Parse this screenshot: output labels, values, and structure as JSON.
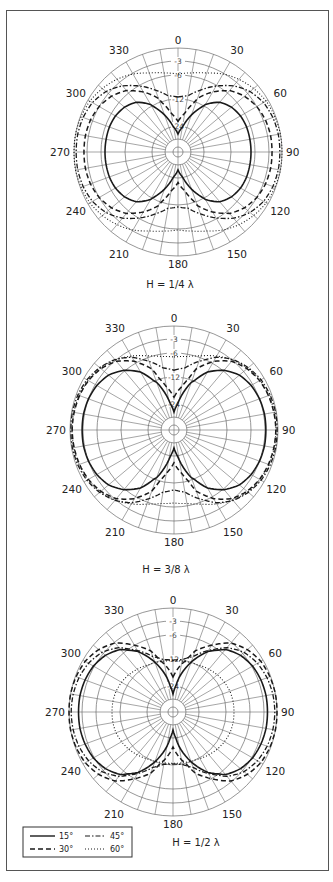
{
  "chart_data": [
    {
      "type": "polar",
      "caption": "H = 1/4 λ",
      "center": [
        178,
        152
      ],
      "angle_labels": [
        "0",
        "30",
        "60",
        "90",
        "120",
        "150",
        "180",
        "210",
        "240",
        "270",
        "300",
        "330"
      ],
      "ring_labels": [
        "-3",
        "-6",
        "-12",
        "-24"
      ],
      "rings_db": [
        0,
        -3,
        -6,
        -12,
        -24
      ],
      "angle_step_deg": 10,
      "series_angles_deg": [
        0,
        10,
        20,
        30,
        40,
        50,
        60,
        70,
        80,
        90
      ],
      "series": [
        {
          "name": "15°",
          "style": "solid",
          "db": [
            -30,
            -24.5,
            -18,
            -11.5,
            -9,
            -7.8,
            -7.2,
            -7,
            -7,
            -7
          ]
        },
        {
          "name": "30°",
          "style": "dashed",
          "db": [
            -22,
            -18,
            -11,
            -7.9,
            -5.3,
            -3.9,
            -3,
            -2.5,
            -2.3,
            -2.3
          ]
        },
        {
          "name": "45°",
          "style": "dashdot",
          "db": [
            -11.5,
            -11,
            -8.8,
            -6.2,
            -4,
            -2.3,
            -1.2,
            -0.7,
            -0.5,
            -0.5
          ]
        },
        {
          "name": "60°",
          "style": "dotted",
          "db": [
            -5.8,
            -5.3,
            -4.5,
            -3.2,
            -2.1,
            -1.2,
            -0.5,
            -0.2,
            0,
            0
          ]
        }
      ]
    },
    {
      "type": "polar",
      "caption": "H = 3/8 λ",
      "center": [
        174,
        430
      ],
      "angle_labels": [
        "0",
        "30",
        "60",
        "90",
        "120",
        "150",
        "180",
        "210",
        "240",
        "270",
        "300",
        "330"
      ],
      "ring_labels": [
        "-3",
        "-6",
        "-12",
        "-24"
      ],
      "rings_db": [
        0,
        -3,
        -6,
        -12,
        -24
      ],
      "angle_step_deg": 10,
      "series_angles_deg": [
        0,
        10,
        20,
        30,
        40,
        50,
        60,
        70,
        80,
        90
      ],
      "series": [
        {
          "name": "15°",
          "style": "solid",
          "db": [
            -30,
            -22,
            -13,
            -8.5,
            -5.8,
            -4.2,
            -3.4,
            -3,
            -2.8,
            -2.8
          ]
        },
        {
          "name": "30°",
          "style": "dashed",
          "db": [
            -21,
            -16,
            -9,
            -5.5,
            -3.3,
            -2,
            -1.2,
            -0.8,
            -0.6,
            -0.5
          ]
        },
        {
          "name": "45°",
          "style": "dashdot",
          "db": [
            -10.3,
            -9.5,
            -7,
            -4.5,
            -2.8,
            -1.6,
            -0.8,
            -0.4,
            -0.2,
            -0.2
          ]
        },
        {
          "name": "60°",
          "style": "dotted",
          "db": [
            -7,
            -6.6,
            -5.6,
            -4.2,
            -2.9,
            -1.8,
            -1.1,
            -0.7,
            -0.5,
            -0.5
          ]
        }
      ]
    },
    {
      "type": "polar",
      "caption": "H = 1/2 λ",
      "center": [
        173,
        712
      ],
      "angle_labels": [
        "0",
        "30",
        "60",
        "90",
        "120",
        "150",
        "180",
        "210",
        "240",
        "270",
        "300",
        "330"
      ],
      "ring_labels": [
        "-3",
        "-6",
        "-12",
        "-24"
      ],
      "rings_db": [
        0,
        -3,
        -6,
        -12,
        -24
      ],
      "angle_step_deg": 10,
      "series_angles_deg": [
        0,
        10,
        20,
        30,
        40,
        50,
        60,
        70,
        80,
        90
      ],
      "series": [
        {
          "name": "15°",
          "style": "solid",
          "db": [
            -30,
            -20,
            -12,
            -7.8,
            -5,
            -3.6,
            -2.8,
            -2.4,
            -2.2,
            -2.2
          ]
        },
        {
          "name": "30°",
          "style": "dashed",
          "db": [
            -20,
            -14,
            -9,
            -6,
            -3.2,
            -1.6,
            -0.6,
            -0.2,
            0,
            0
          ]
        },
        {
          "name": "45°",
          "style": "dashdot",
          "db": [
            -12.5,
            -12,
            -10.5,
            -7.5,
            -4.5,
            -2.6,
            -1.5,
            -0.9,
            -0.6,
            -0.5
          ]
        },
        {
          "name": "60°",
          "style": "dotted",
          "db": [
            -12.8,
            -12.6,
            -12.3,
            -11.8,
            -11.3,
            -10.8,
            -10.4,
            -10.1,
            -10,
            -10
          ]
        }
      ]
    }
  ],
  "legend": {
    "items": [
      {
        "label": "15°",
        "style": "solid"
      },
      {
        "label": "45°",
        "style": "dashdot"
      },
      {
        "label": "30°",
        "style": "dashed"
      },
      {
        "label": "60°",
        "style": "dotted"
      }
    ]
  },
  "colors": {
    "grid": "#6a6a6a",
    "curve": "#1a1a1a",
    "frame": "#555555"
  }
}
